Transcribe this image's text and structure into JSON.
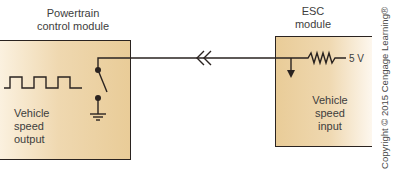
{
  "diagram": {
    "left_module": {
      "title_line1": "Powertrain",
      "title_line2": "control module",
      "body_line1": "Vehicle",
      "body_line2": "speed",
      "body_line3": "output"
    },
    "right_module": {
      "title_line1": "ESC",
      "title_line2": "module",
      "body_line1": "Vehicle",
      "body_line2": "speed",
      "body_line3": "input",
      "voltage_label": "5 V"
    },
    "symbols": [
      "square-wave",
      "switch",
      "ground",
      "connector-chevrons",
      "resistor",
      "down-arrow"
    ],
    "colors": {
      "line": "#2a2320",
      "module_fill_dark": "#e9cc98",
      "module_fill_light": "#fbf1df"
    },
    "copyright": "Copyright © 2015 Cengage Learning®"
  }
}
